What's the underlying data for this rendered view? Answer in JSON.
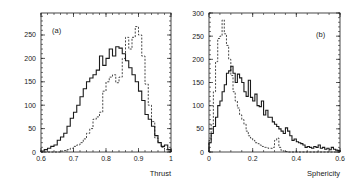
{
  "chart_data": [
    {
      "type": "histogram",
      "panel_label": "(a)",
      "xlabel": "Thrust",
      "ylabel": "",
      "xlim": [
        0.6,
        1.0
      ],
      "ylim": [
        0,
        297
      ],
      "xticks": [
        0.6,
        0.7,
        0.8,
        0.9,
        1.0
      ],
      "xtick_labels": [
        "0.6",
        "0.7",
        "0.8",
        "0.9",
        "1"
      ],
      "yticks": [
        0,
        50,
        100,
        150,
        200,
        250
      ],
      "ytick_labels": [
        "0",
        "50",
        "100",
        "150",
        "200",
        "250"
      ],
      "grid": false,
      "legend": null,
      "bin_width": 0.01,
      "bin_edges_start": 0.6,
      "series": [
        {
          "name": "solid",
          "style": "solid",
          "values": [
            2,
            5,
            8,
            12,
            15,
            25,
            32,
            40,
            55,
            72,
            85,
            100,
            118,
            135,
            150,
            158,
            165,
            175,
            205,
            185,
            200,
            220,
            205,
            225,
            222,
            210,
            195,
            180,
            165,
            150,
            130,
            110,
            80,
            70,
            55,
            35,
            20,
            12,
            15,
            5
          ]
        },
        {
          "name": "dashed",
          "style": "dashed",
          "values": [
            0,
            0,
            0,
            0,
            0,
            0,
            2,
            3,
            5,
            8,
            12,
            15,
            20,
            28,
            40,
            50,
            70,
            75,
            85,
            130,
            150,
            160,
            165,
            148,
            160,
            200,
            245,
            220,
            245,
            268,
            250,
            205,
            145,
            100,
            65,
            30,
            20,
            10,
            5,
            2
          ]
        }
      ]
    },
    {
      "type": "histogram",
      "panel_label": "(b)",
      "xlabel": "Sphericity",
      "ylabel": "",
      "xlim": [
        0.0,
        0.6
      ],
      "ylim": [
        0,
        300
      ],
      "xticks": [
        0.0,
        0.2,
        0.4,
        0.6
      ],
      "xtick_labels": [
        "0",
        "0.2",
        "0.4",
        "0.6"
      ],
      "yticks": [
        0,
        50,
        100,
        150,
        200,
        250,
        300
      ],
      "ytick_labels": [
        "0",
        "50",
        "100",
        "150",
        "200",
        "250",
        "300"
      ],
      "grid": false,
      "legend": null,
      "bin_width": 0.01,
      "bin_edges_start": 0.0,
      "series": [
        {
          "name": "solid",
          "style": "solid",
          "values": [
            20,
            40,
            55,
            75,
            100,
            110,
            130,
            145,
            170,
            175,
            185,
            170,
            150,
            168,
            160,
            150,
            130,
            120,
            155,
            118,
            110,
            125,
            100,
            98,
            110,
            80,
            90,
            75,
            75,
            65,
            60,
            55,
            50,
            45,
            40,
            52,
            45,
            35,
            25,
            28,
            22,
            20,
            18,
            15,
            10,
            12,
            10,
            8,
            12,
            10,
            15,
            8,
            10,
            6,
            8,
            5,
            10,
            6,
            4,
            3
          ]
        },
        {
          "name": "dashed",
          "style": "dashed",
          "values": [
            25,
            60,
            130,
            195,
            245,
            250,
            285,
            255,
            230,
            200,
            165,
            130,
            110,
            95,
            80,
            70,
            60,
            45,
            35,
            30,
            25,
            20,
            18,
            15,
            12,
            10,
            10,
            8,
            8,
            10,
            25,
            30,
            10,
            3,
            2,
            1,
            0,
            0,
            0,
            0,
            0,
            0,
            0,
            0,
            0,
            0,
            0,
            0,
            0,
            0,
            0,
            0,
            0,
            0,
            0,
            0,
            0,
            0,
            0,
            0
          ]
        }
      ]
    }
  ],
  "panels": {
    "left": {
      "tag": "(a)",
      "xlabel": "Thrust"
    },
    "right": {
      "tag": "(b)",
      "xlabel": "Sphericity"
    }
  },
  "colors": {
    "line": "#1a1a1a",
    "background": "#ffffff",
    "text": "#222222"
  }
}
